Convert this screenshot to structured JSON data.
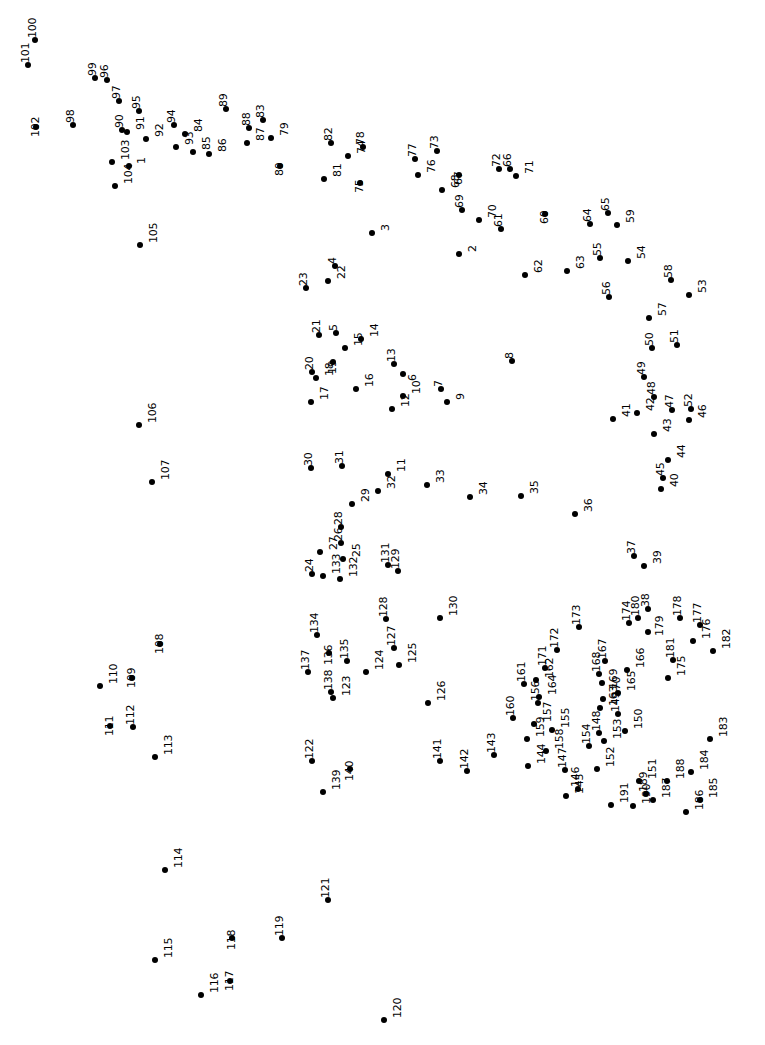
{
  "page": {
    "width": 765,
    "height": 1045,
    "background_color": "#ffffff",
    "dot_color": "#000000",
    "label_color": "#000000",
    "label_rotation_degrees": -90,
    "dot_radius_px": 3,
    "total_dots": 191
  },
  "chart_data": {
    "type": "scatter",
    "title": "",
    "subtitle": "",
    "xlabel": "",
    "ylabel": "",
    "xlim": [
      0,
      765
    ],
    "ylim": [
      0,
      1045
    ],
    "grid": false,
    "legend": null,
    "axes_visible": false,
    "tick_labels": [],
    "annotations": [],
    "point_label_key": "n",
    "points": [
      {
        "n": 1,
        "x": 129,
        "y": 166
      },
      {
        "n": 2,
        "x": 459,
        "y": 254
      },
      {
        "n": 3,
        "x": 372,
        "y": 233
      },
      {
        "n": 4,
        "x": 335,
        "y": 266
      },
      {
        "n": 5,
        "x": 336,
        "y": 333
      },
      {
        "n": 6,
        "x": 403,
        "y": 374
      },
      {
        "n": 7,
        "x": 441,
        "y": 389
      },
      {
        "n": 8,
        "x": 512,
        "y": 361
      },
      {
        "n": 9,
        "x": 447,
        "y": 402
      },
      {
        "n": 10,
        "x": 403,
        "y": 396
      },
      {
        "n": 11,
        "x": 388,
        "y": 474
      },
      {
        "n": 12,
        "x": 392,
        "y": 409
      },
      {
        "n": 13,
        "x": 394,
        "y": 364
      },
      {
        "n": 14,
        "x": 361,
        "y": 339
      },
      {
        "n": 15,
        "x": 345,
        "y": 348
      },
      {
        "n": 16,
        "x": 356,
        "y": 389
      },
      {
        "n": 17,
        "x": 311,
        "y": 402
      },
      {
        "n": 18,
        "x": 316,
        "y": 378
      },
      {
        "n": 19,
        "x": 333,
        "y": 362
      },
      {
        "n": 20,
        "x": 312,
        "y": 372
      },
      {
        "n": 21,
        "x": 319,
        "y": 335
      },
      {
        "n": 22,
        "x": 328,
        "y": 281
      },
      {
        "n": 23,
        "x": 306,
        "y": 288
      },
      {
        "n": 24,
        "x": 312,
        "y": 574
      },
      {
        "n": 25,
        "x": 343,
        "y": 559
      },
      {
        "n": 26,
        "x": 341,
        "y": 543
      },
      {
        "n": 27,
        "x": 320,
        "y": 552
      },
      {
        "n": 28,
        "x": 341,
        "y": 527
      },
      {
        "n": 29,
        "x": 352,
        "y": 504
      },
      {
        "n": 30,
        "x": 311,
        "y": 468
      },
      {
        "n": 31,
        "x": 342,
        "y": 466
      },
      {
        "n": 32,
        "x": 378,
        "y": 491
      },
      {
        "n": 33,
        "x": 427,
        "y": 485
      },
      {
        "n": 34,
        "x": 470,
        "y": 497
      },
      {
        "n": 35,
        "x": 521,
        "y": 496
      },
      {
        "n": 36,
        "x": 575,
        "y": 514
      },
      {
        "n": 37,
        "x": 634,
        "y": 556
      },
      {
        "n": 38,
        "x": 648,
        "y": 609
      },
      {
        "n": 39,
        "x": 644,
        "y": 566
      },
      {
        "n": 40,
        "x": 661,
        "y": 489
      },
      {
        "n": 41,
        "x": 613,
        "y": 419
      },
      {
        "n": 42,
        "x": 637,
        "y": 413
      },
      {
        "n": 43,
        "x": 654,
        "y": 434
      },
      {
        "n": 44,
        "x": 668,
        "y": 460
      },
      {
        "n": 45,
        "x": 663,
        "y": 478
      },
      {
        "n": 46,
        "x": 689,
        "y": 420
      },
      {
        "n": 47,
        "x": 672,
        "y": 410
      },
      {
        "n": 48,
        "x": 654,
        "y": 397
      },
      {
        "n": 49,
        "x": 644,
        "y": 377
      },
      {
        "n": 50,
        "x": 652,
        "y": 348
      },
      {
        "n": 51,
        "x": 677,
        "y": 345
      },
      {
        "n": 52,
        "x": 691,
        "y": 409
      },
      {
        "n": 53,
        "x": 689,
        "y": 295
      },
      {
        "n": 54,
        "x": 628,
        "y": 261
      },
      {
        "n": 55,
        "x": 600,
        "y": 258
      },
      {
        "n": 56,
        "x": 609,
        "y": 297
      },
      {
        "n": 57,
        "x": 649,
        "y": 318
      },
      {
        "n": 58,
        "x": 671,
        "y": 280
      },
      {
        "n": 59,
        "x": 617,
        "y": 225
      },
      {
        "n": 60,
        "x": 545,
        "y": 214
      },
      {
        "n": 61,
        "x": 501,
        "y": 229
      },
      {
        "n": 62,
        "x": 525,
        "y": 275
      },
      {
        "n": 63,
        "x": 567,
        "y": 271
      },
      {
        "n": 64,
        "x": 590,
        "y": 224
      },
      {
        "n": 65,
        "x": 608,
        "y": 213
      },
      {
        "n": 66,
        "x": 510,
        "y": 169
      },
      {
        "n": 67,
        "x": 459,
        "y": 175
      },
      {
        "n": 68,
        "x": 442,
        "y": 190
      },
      {
        "n": 69,
        "x": 462,
        "y": 210
      },
      {
        "n": 70,
        "x": 479,
        "y": 220
      },
      {
        "n": 71,
        "x": 516,
        "y": 176
      },
      {
        "n": 72,
        "x": 499,
        "y": 169
      },
      {
        "n": 73,
        "x": 437,
        "y": 151
      },
      {
        "n": 74,
        "x": 348,
        "y": 156
      },
      {
        "n": 75,
        "x": 360,
        "y": 183
      },
      {
        "n": 76,
        "x": 418,
        "y": 175
      },
      {
        "n": 77,
        "x": 415,
        "y": 159
      },
      {
        "n": 78,
        "x": 363,
        "y": 147
      },
      {
        "n": 79,
        "x": 271,
        "y": 138
      },
      {
        "n": 80,
        "x": 280,
        "y": 166
      },
      {
        "n": 81,
        "x": 324,
        "y": 179
      },
      {
        "n": 82,
        "x": 331,
        "y": 143
      },
      {
        "n": 83,
        "x": 263,
        "y": 120
      },
      {
        "n": 84,
        "x": 185,
        "y": 134
      },
      {
        "n": 85,
        "x": 193,
        "y": 152
      },
      {
        "n": 86,
        "x": 209,
        "y": 154
      },
      {
        "n": 87,
        "x": 247,
        "y": 143
      },
      {
        "n": 88,
        "x": 249,
        "y": 128
      },
      {
        "n": 89,
        "x": 226,
        "y": 109
      },
      {
        "n": 90,
        "x": 122,
        "y": 130
      },
      {
        "n": 91,
        "x": 127,
        "y": 132
      },
      {
        "n": 92,
        "x": 146,
        "y": 139
      },
      {
        "n": 93,
        "x": 176,
        "y": 147
      },
      {
        "n": 94,
        "x": 174,
        "y": 125
      },
      {
        "n": 95,
        "x": 139,
        "y": 111
      },
      {
        "n": 96,
        "x": 107,
        "y": 80
      },
      {
        "n": 97,
        "x": 119,
        "y": 101
      },
      {
        "n": 98,
        "x": 73,
        "y": 125
      },
      {
        "n": 99,
        "x": 95,
        "y": 78
      },
      {
        "n": 100,
        "x": 35,
        "y": 40
      },
      {
        "n": 101,
        "x": 28,
        "y": 65
      },
      {
        "n": 102,
        "x": 36,
        "y": 127
      },
      {
        "n": 103,
        "x": 112,
        "y": 162
      },
      {
        "n": 104,
        "x": 115,
        "y": 186
      },
      {
        "n": 105,
        "x": 140,
        "y": 245
      },
      {
        "n": 106,
        "x": 139,
        "y": 425
      },
      {
        "n": 107,
        "x": 152,
        "y": 482
      },
      {
        "n": 108,
        "x": 160,
        "y": 644
      },
      {
        "n": 109,
        "x": 132,
        "y": 678
      },
      {
        "n": 110,
        "x": 100,
        "y": 686
      },
      {
        "n": 111,
        "x": 110,
        "y": 726
      },
      {
        "n": 112,
        "x": 133,
        "y": 727
      },
      {
        "n": 113,
        "x": 155,
        "y": 757
      },
      {
        "n": 114,
        "x": 165,
        "y": 870
      },
      {
        "n": 115,
        "x": 155,
        "y": 960
      },
      {
        "n": 116,
        "x": 201,
        "y": 995
      },
      {
        "n": 117,
        "x": 230,
        "y": 981
      },
      {
        "n": 118,
        "x": 232,
        "y": 938
      },
      {
        "n": 119,
        "x": 282,
        "y": 938
      },
      {
        "n": 120,
        "x": 384,
        "y": 1020
      },
      {
        "n": 121,
        "x": 328,
        "y": 900
      },
      {
        "n": 122,
        "x": 312,
        "y": 761
      },
      {
        "n": 123,
        "x": 333,
        "y": 698
      },
      {
        "n": 124,
        "x": 366,
        "y": 672
      },
      {
        "n": 125,
        "x": 399,
        "y": 665
      },
      {
        "n": 126,
        "x": 428,
        "y": 703
      },
      {
        "n": 127,
        "x": 394,
        "y": 648
      },
      {
        "n": 128,
        "x": 386,
        "y": 619
      },
      {
        "n": 129,
        "x": 398,
        "y": 571
      },
      {
        "n": 130,
        "x": 440,
        "y": 618
      },
      {
        "n": 131,
        "x": 388,
        "y": 565
      },
      {
        "n": 132,
        "x": 340,
        "y": 579
      },
      {
        "n": 133,
        "x": 323,
        "y": 576
      },
      {
        "n": 134,
        "x": 317,
        "y": 635
      },
      {
        "n": 135,
        "x": 347,
        "y": 661
      },
      {
        "n": 136,
        "x": 329,
        "y": 653
      },
      {
        "n": 137,
        "x": 308,
        "y": 672
      },
      {
        "n": 138,
        "x": 331,
        "y": 692
      },
      {
        "n": 139,
        "x": 323,
        "y": 792
      },
      {
        "n": 140,
        "x": 350,
        "y": 769
      },
      {
        "n": 141,
        "x": 440,
        "y": 761
      },
      {
        "n": 142,
        "x": 467,
        "y": 771
      },
      {
        "n": 143,
        "x": 494,
        "y": 755
      },
      {
        "n": 144,
        "x": 528,
        "y": 766
      },
      {
        "n": 145,
        "x": 566,
        "y": 796
      },
      {
        "n": 146,
        "x": 578,
        "y": 789
      },
      {
        "n": 147,
        "x": 565,
        "y": 770
      },
      {
        "n": 148,
        "x": 599,
        "y": 733
      },
      {
        "n": 149,
        "x": 618,
        "y": 714
      },
      {
        "n": 150,
        "x": 625,
        "y": 731
      },
      {
        "n": 151,
        "x": 639,
        "y": 781
      },
      {
        "n": 152,
        "x": 597,
        "y": 769
      },
      {
        "n": 153,
        "x": 604,
        "y": 741
      },
      {
        "n": 154,
        "x": 589,
        "y": 746
      },
      {
        "n": 155,
        "x": 552,
        "y": 730
      },
      {
        "n": 156,
        "x": 538,
        "y": 703
      },
      {
        "n": 157,
        "x": 534,
        "y": 724
      },
      {
        "n": 158,
        "x": 546,
        "y": 751
      },
      {
        "n": 159,
        "x": 527,
        "y": 739
      },
      {
        "n": 160,
        "x": 513,
        "y": 718
      },
      {
        "n": 161,
        "x": 524,
        "y": 684
      },
      {
        "n": 162,
        "x": 536,
        "y": 680
      },
      {
        "n": 163,
        "x": 600,
        "y": 708
      },
      {
        "n": 164,
        "x": 539,
        "y": 697
      },
      {
        "n": 165,
        "x": 618,
        "y": 693
      },
      {
        "n": 166,
        "x": 627,
        "y": 670
      },
      {
        "n": 167,
        "x": 605,
        "y": 661
      },
      {
        "n": 168,
        "x": 599,
        "y": 674
      },
      {
        "n": 169,
        "x": 602,
        "y": 683
      },
      {
        "n": 170,
        "x": 603,
        "y": 699
      },
      {
        "n": 171,
        "x": 545,
        "y": 668
      },
      {
        "n": 172,
        "x": 557,
        "y": 650
      },
      {
        "n": 173,
        "x": 579,
        "y": 627
      },
      {
        "n": 174,
        "x": 629,
        "y": 623
      },
      {
        "n": 175,
        "x": 668,
        "y": 678
      },
      {
        "n": 176,
        "x": 693,
        "y": 641
      },
      {
        "n": 177,
        "x": 700,
        "y": 625
      },
      {
        "n": 178,
        "x": 680,
        "y": 618
      },
      {
        "n": 179,
        "x": 648,
        "y": 632
      },
      {
        "n": 180,
        "x": 638,
        "y": 618
      },
      {
        "n": 181,
        "x": 673,
        "y": 660
      },
      {
        "n": 182,
        "x": 713,
        "y": 651
      },
      {
        "n": 183,
        "x": 710,
        "y": 739
      },
      {
        "n": 184,
        "x": 691,
        "y": 772
      },
      {
        "n": 185,
        "x": 700,
        "y": 800
      },
      {
        "n": 186,
        "x": 686,
        "y": 812
      },
      {
        "n": 187,
        "x": 653,
        "y": 800
      },
      {
        "n": 188,
        "x": 667,
        "y": 781
      },
      {
        "n": 189,
        "x": 646,
        "y": 794
      },
      {
        "n": 190,
        "x": 633,
        "y": 806
      },
      {
        "n": 191,
        "x": 611,
        "y": 805
      }
    ]
  }
}
